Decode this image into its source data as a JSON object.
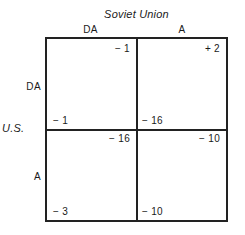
{
  "diagram": {
    "type": "payoff-matrix",
    "column_player": {
      "name": "Soviet Union",
      "strategies": [
        "DA",
        "A"
      ]
    },
    "row_player": {
      "name": "U.S.",
      "strategies": [
        "DA",
        "A"
      ]
    },
    "cells": [
      {
        "row": "DA",
        "column": "DA",
        "row_payoff": "− 1",
        "column_payoff": "− 1"
      },
      {
        "row": "DA",
        "column": "A",
        "row_payoff": "− 16",
        "column_payoff": "+ 2"
      },
      {
        "row": "A",
        "column": "DA",
        "row_payoff": "− 3",
        "column_payoff": "− 16"
      },
      {
        "row": "A",
        "column": "A",
        "row_payoff": "− 10",
        "column_payoff": "− 10"
      }
    ],
    "colors": {
      "border": "#222222",
      "background": "#ffffff",
      "text": "#1a1a1a"
    }
  }
}
